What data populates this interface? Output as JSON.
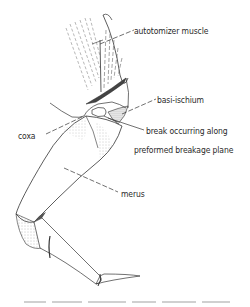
{
  "figure": {
    "labels": {
      "autotomizer_muscle": "autotomizer muscle",
      "basi_ischium": "basi-ischium",
      "coxa": "coxa",
      "break_line1": "break occurring along",
      "break_line2": "preformed breakage plane",
      "merus": "merus"
    },
    "colors": {
      "ink": "#2a2a2a",
      "stipple": "#8a8a8a",
      "background": "#ffffff"
    }
  }
}
